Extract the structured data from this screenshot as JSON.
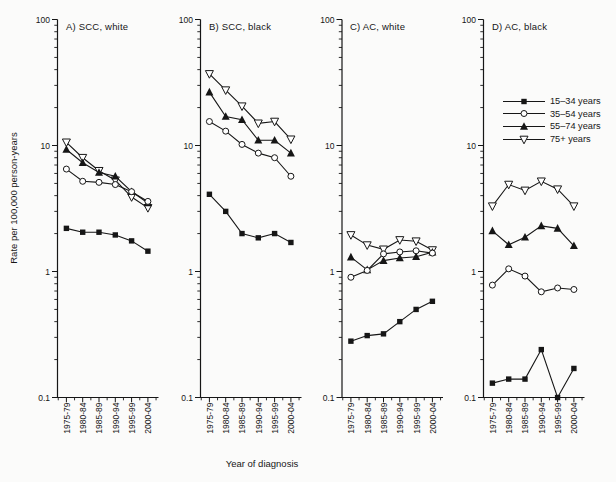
{
  "chart_data": {
    "type": "line",
    "y_scale": "log",
    "ylim": [
      0.1,
      100
    ],
    "y_tick_values": [
      0.1,
      1,
      10,
      100
    ],
    "y_tick_labels": [
      "0.1",
      "1",
      "10",
      "100"
    ],
    "categories": [
      "1975-79",
      "1980-84",
      "1985-89",
      "1990-94",
      "1995-99",
      "2000-04"
    ],
    "xlabel": "Year of diagnosis",
    "ylabel": "Rate per 100,000 person-years",
    "grid": false,
    "legend_position": "right",
    "colors": {
      "ink": "#161616",
      "open_marker_fill": "#ffffff"
    },
    "legend": [
      {
        "label": "15–34 years",
        "marker": "square-filled"
      },
      {
        "label": "35–54 years",
        "marker": "circle-open"
      },
      {
        "label": "55–74 years",
        "marker": "triangle-up-filled"
      },
      {
        "label": "75+ years",
        "marker": "triangle-down-open"
      }
    ],
    "panels": [
      {
        "title": "A) SCC, white",
        "series": [
          {
            "name": "15–34 years",
            "values": [
              2.2,
              2.05,
              2.05,
              1.95,
              1.75,
              1.45
            ]
          },
          {
            "name": "35–54 years",
            "values": [
              6.5,
              5.2,
              5.1,
              4.9,
              4.3,
              3.6
            ]
          },
          {
            "name": "55–74 years",
            "values": [
              9.3,
              7.3,
              6.1,
              5.7,
              4.3,
              3.5
            ]
          },
          {
            "name": "75+ years",
            "values": [
              10.6,
              8.0,
              6.3,
              5.3,
              3.9,
              3.2
            ]
          }
        ]
      },
      {
        "title": "B) SCC, black",
        "series": [
          {
            "name": "15–34 years",
            "values": [
              4.1,
              3.0,
              2.0,
              1.85,
              2.0,
              1.7
            ]
          },
          {
            "name": "35–54 years",
            "values": [
              15.5,
              13.0,
              10.2,
              8.7,
              8.0,
              5.7
            ]
          },
          {
            "name": "55–74 years",
            "values": [
              26.5,
              17.0,
              16.0,
              11.0,
              11.0,
              8.7
            ]
          },
          {
            "name": "75+ years",
            "values": [
              37.0,
              27.5,
              20.5,
              15.0,
              15.5,
              11.2
            ]
          }
        ]
      },
      {
        "title": "C) AC, white",
        "series": [
          {
            "name": "15–34 years",
            "values": [
              0.28,
              0.31,
              0.32,
              0.4,
              0.5,
              0.58
            ]
          },
          {
            "name": "35–54 years",
            "values": [
              0.9,
              1.02,
              1.38,
              1.43,
              1.46,
              1.4
            ]
          },
          {
            "name": "55–74 years",
            "values": [
              1.3,
              1.03,
              1.22,
              1.28,
              1.31,
              1.42
            ]
          },
          {
            "name": "75+ years",
            "values": [
              1.95,
              1.62,
              1.5,
              1.78,
              1.74,
              1.48
            ]
          }
        ]
      },
      {
        "title": "D) AC, black",
        "series": [
          {
            "name": "15–34 years",
            "values": [
              0.13,
              0.14,
              0.14,
              0.24,
              0.1,
              0.17
            ]
          },
          {
            "name": "35–54 years",
            "values": [
              0.78,
              1.05,
              0.92,
              0.69,
              0.74,
              0.72
            ]
          },
          {
            "name": "55–74 years",
            "values": [
              2.1,
              1.63,
              1.87,
              2.3,
              2.2,
              1.6
            ]
          },
          {
            "name": "75+ years",
            "values": [
              3.3,
              4.9,
              4.4,
              5.2,
              4.5,
              3.3
            ]
          }
        ]
      }
    ]
  }
}
